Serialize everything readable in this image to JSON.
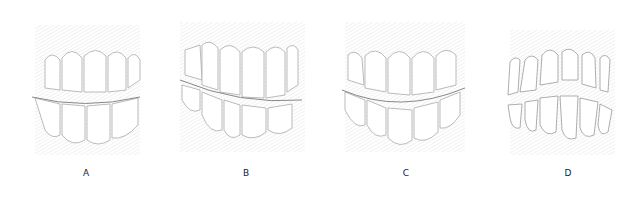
{
  "figure": {
    "panels": [
      {
        "id": "A",
        "label": "A",
        "description": "teeth in normal occlusion, upper and lower incisors meeting evenly"
      },
      {
        "id": "B",
        "label": "B",
        "description": "teeth with deep overbite, upper incisors overlapping lower"
      },
      {
        "id": "C",
        "label": "C",
        "description": "teeth with edge-to-edge / crossbite irregular occlusal line"
      },
      {
        "id": "D",
        "label": "D",
        "description": "teeth with open bite, gap between upper and lower teeth"
      }
    ]
  }
}
